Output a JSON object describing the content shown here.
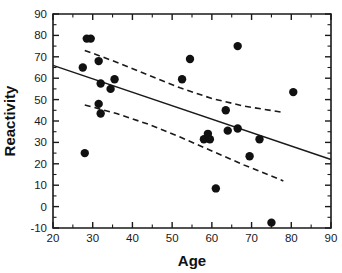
{
  "chart_data": {
    "type": "scatter",
    "title": "",
    "xlabel": "Age",
    "ylabel": "Reactivity",
    "xlim": [
      20,
      90
    ],
    "ylim": [
      -10,
      90
    ],
    "xticks": [
      20,
      30,
      40,
      50,
      60,
      70,
      80,
      90
    ],
    "yticks": [
      -10,
      0,
      10,
      20,
      30,
      40,
      50,
      60,
      70,
      80,
      90
    ],
    "xtick_labels": [
      "20",
      "30",
      "40",
      "50",
      "60",
      "70",
      "80",
      "90"
    ],
    "ytick_labels": [
      "-10",
      "0",
      "10",
      "20",
      "30",
      "40",
      "50",
      "60",
      "70",
      "80",
      "90"
    ],
    "xtick_minor_step": 5,
    "ytick_minor_step": 5,
    "grid": false,
    "legend": null,
    "marker": "filled-circle",
    "marker_color": "#111111",
    "points": [
      {
        "x": 27.5,
        "y": 65.0
      },
      {
        "x": 28.0,
        "y": 25.0
      },
      {
        "x": 28.5,
        "y": 78.5
      },
      {
        "x": 29.5,
        "y": 78.5
      },
      {
        "x": 31.5,
        "y": 68.0
      },
      {
        "x": 31.5,
        "y": 48.0
      },
      {
        "x": 32.0,
        "y": 57.5
      },
      {
        "x": 32.0,
        "y": 43.5
      },
      {
        "x": 34.5,
        "y": 55.0
      },
      {
        "x": 35.5,
        "y": 59.5
      },
      {
        "x": 52.5,
        "y": 59.5
      },
      {
        "x": 54.5,
        "y": 69.0
      },
      {
        "x": 58.0,
        "y": 31.5
      },
      {
        "x": 59.0,
        "y": 34.0
      },
      {
        "x": 59.5,
        "y": 31.5
      },
      {
        "x": 61.0,
        "y": 8.5
      },
      {
        "x": 63.5,
        "y": 45.0
      },
      {
        "x": 64.0,
        "y": 35.5
      },
      {
        "x": 66.5,
        "y": 75.0
      },
      {
        "x": 66.5,
        "y": 36.5
      },
      {
        "x": 69.5,
        "y": 23.5
      },
      {
        "x": 72.0,
        "y": 31.5
      },
      {
        "x": 75.0,
        "y": -7.5
      },
      {
        "x": 80.5,
        "y": 53.5
      }
    ],
    "regression_line": {
      "style": "solid",
      "x_start": 20.0,
      "y_start": 66.0,
      "x_end": 90.0,
      "y_end": 22.0
    },
    "confidence_bands": [
      {
        "name": "upper-confidence-band",
        "style": "dashed",
        "points": [
          {
            "x": 28.0,
            "y": 73.0
          },
          {
            "x": 36.0,
            "y": 67.5
          },
          {
            "x": 44.0,
            "y": 61.5
          },
          {
            "x": 52.0,
            "y": 55.5
          },
          {
            "x": 60.0,
            "y": 50.5
          },
          {
            "x": 68.0,
            "y": 47.0
          },
          {
            "x": 78.0,
            "y": 44.0
          }
        ]
      },
      {
        "name": "lower-confidence-band",
        "style": "dashed",
        "points": [
          {
            "x": 28.0,
            "y": 47.5
          },
          {
            "x": 36.0,
            "y": 43.5
          },
          {
            "x": 44.0,
            "y": 38.5
          },
          {
            "x": 52.0,
            "y": 32.5
          },
          {
            "x": 60.0,
            "y": 26.0
          },
          {
            "x": 68.0,
            "y": 19.5
          },
          {
            "x": 78.0,
            "y": 12.0
          }
        ]
      }
    ]
  },
  "axes": {
    "x_title": "Age",
    "y_title": "Reactivity"
  }
}
